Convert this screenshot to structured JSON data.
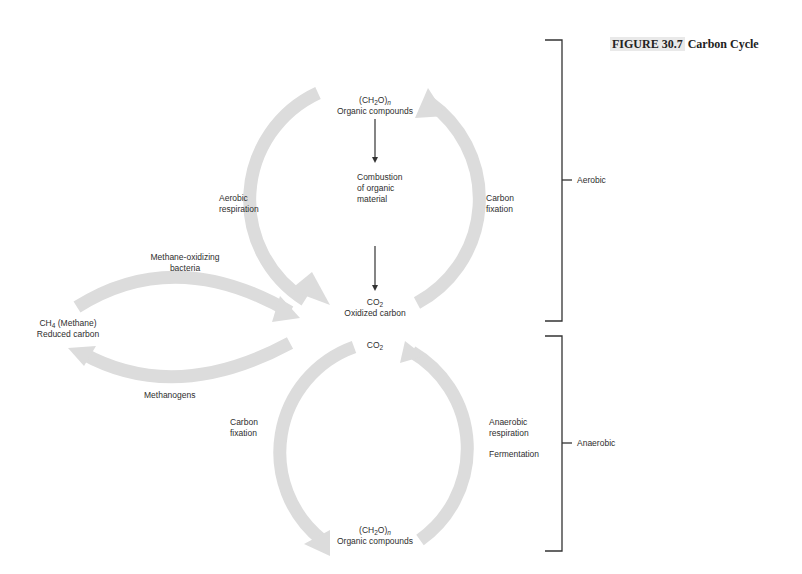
{
  "figure": {
    "tag": "FIGURE 30.7",
    "title": "Carbon Cycle"
  },
  "nodes": {
    "top_organic": {
      "formula_main": "(CH",
      "formula_sub": "2",
      "formula_tail": "O)",
      "formula_n": "n",
      "label": "Organic compounds"
    },
    "oxidized_co2": {
      "formula_main": "CO",
      "formula_sub": "2",
      "label": "Oxidized carbon"
    },
    "methane": {
      "formula_main": "CH",
      "formula_sub": "4",
      "formula_tail": " (Methane)",
      "label": "Reduced carbon"
    },
    "lower_co2": {
      "formula_main": "CO",
      "formula_sub": "2"
    },
    "bottom_organic": {
      "formula_main": "(CH",
      "formula_sub": "2",
      "formula_tail": "O)",
      "formula_n": "n",
      "label": "Organic compounds"
    }
  },
  "processes": {
    "combustion": [
      "Combustion",
      "of organic",
      "material"
    ],
    "aerobic_respiration": [
      "Aerobic",
      "respiration"
    ],
    "carbon_fixation_top": [
      "Carbon",
      "fixation"
    ],
    "methane_oxidizing": [
      "Methane-oxidizing",
      "bacteria"
    ],
    "methanogens": [
      "Methanogens"
    ],
    "carbon_fixation_bottom": [
      "Carbon",
      "fixation"
    ],
    "anaerobic_respiration": [
      "Anaerobic",
      "respiration"
    ],
    "fermentation": [
      "Fermentation"
    ]
  },
  "brackets": {
    "aerobic": "Aerobic",
    "anaerobic": "Anaerobic"
  },
  "colors": {
    "arc": "#dcdcdc",
    "line": "#333333",
    "title_tag_bg": "#e9e9e9"
  }
}
